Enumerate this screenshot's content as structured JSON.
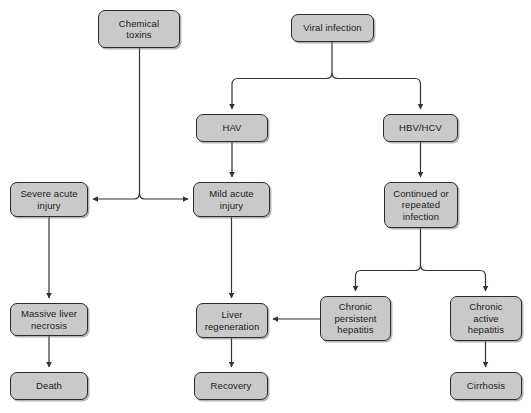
{
  "diagram": {
    "node_fill": "#c9c9c9",
    "node_stroke": "#2b2b2b",
    "edge_color": "#333333",
    "background": "#ffffff",
    "nodes": [
      {
        "id": "chemical-toxins",
        "label": "Chemical\ntoxins",
        "x": 98,
        "y": 10,
        "w": 82,
        "h": 38
      },
      {
        "id": "viral-infection",
        "label": "Viral infection",
        "x": 291,
        "y": 14,
        "w": 83,
        "h": 28
      },
      {
        "id": "hav",
        "label": "HAV",
        "x": 196,
        "y": 114,
        "w": 72,
        "h": 28
      },
      {
        "id": "hbv-hcv",
        "label": "HBV/HCV",
        "x": 383,
        "y": 114,
        "w": 75,
        "h": 28
      },
      {
        "id": "severe-acute-injury",
        "label": "Severe acute\ninjury",
        "x": 10,
        "y": 182,
        "w": 78,
        "h": 35
      },
      {
        "id": "mild-acute-injury",
        "label": "Mild acute\ninjury",
        "x": 193,
        "y": 182,
        "w": 77,
        "h": 35
      },
      {
        "id": "continued-repeated-infection",
        "label": "Continued or\nrepeated\ninfection",
        "x": 384,
        "y": 182,
        "w": 74,
        "h": 46
      },
      {
        "id": "massive-liver-necrosis",
        "label": "Massive liver\nnecrosis",
        "x": 10,
        "y": 303,
        "w": 78,
        "h": 33
      },
      {
        "id": "liver-regeneration",
        "label": "Liver\nregeneration",
        "x": 196,
        "y": 303,
        "w": 72,
        "h": 35
      },
      {
        "id": "chronic-persistent-hepatitis",
        "label": "Chronic\npersistent\nhepatitis",
        "x": 320,
        "y": 296,
        "w": 71,
        "h": 45
      },
      {
        "id": "chronic-active-hepatitis",
        "label": "Chronic\nactive\nhepatitis",
        "x": 450,
        "y": 296,
        "w": 72,
        "h": 45
      },
      {
        "id": "death",
        "label": "Death",
        "x": 10,
        "y": 372,
        "w": 78,
        "h": 28
      },
      {
        "id": "recovery",
        "label": "Recovery",
        "x": 194,
        "y": 372,
        "w": 74,
        "h": 28
      },
      {
        "id": "cirrhosis",
        "label": "Cirrhosis",
        "x": 450,
        "y": 372,
        "w": 72,
        "h": 28
      }
    ],
    "edges": [
      {
        "id": "chemical-toxins-to-severe-acute-injury",
        "from": "chemical-toxins",
        "to": "severe-acute-injury",
        "arrow": true
      },
      {
        "id": "chemical-toxins-to-mild-acute-injury",
        "from": "chemical-toxins",
        "to": "mild-acute-injury",
        "arrow": true
      },
      {
        "id": "viral-infection-to-hav",
        "from": "viral-infection",
        "to": "hav",
        "arrow": true
      },
      {
        "id": "viral-infection-to-hbv-hcv",
        "from": "viral-infection",
        "to": "hbv-hcv",
        "arrow": true
      },
      {
        "id": "hav-to-mild-acute-injury",
        "from": "hav",
        "to": "mild-acute-injury",
        "arrow": true
      },
      {
        "id": "hbv-hcv-to-continued-repeated-infection",
        "from": "hbv-hcv",
        "to": "continued-repeated-infection",
        "arrow": true
      },
      {
        "id": "severe-acute-injury-to-massive-liver-necrosis",
        "from": "severe-acute-injury",
        "to": "massive-liver-necrosis",
        "arrow": true
      },
      {
        "id": "mild-acute-injury-to-liver-regeneration",
        "from": "mild-acute-injury",
        "to": "liver-regeneration",
        "arrow": true
      },
      {
        "id": "continued-repeated-infection-to-chronic-persistent-hepatitis",
        "from": "continued-repeated-infection",
        "to": "chronic-persistent-hepatitis",
        "arrow": true
      },
      {
        "id": "continued-repeated-infection-to-chronic-active-hepatitis",
        "from": "continued-repeated-infection",
        "to": "chronic-active-hepatitis",
        "arrow": true
      },
      {
        "id": "massive-liver-necrosis-to-death",
        "from": "massive-liver-necrosis",
        "to": "death",
        "arrow": true
      },
      {
        "id": "liver-regeneration-to-recovery",
        "from": "liver-regeneration",
        "to": "recovery",
        "arrow": true
      },
      {
        "id": "chronic-persistent-hepatitis-to-liver-regeneration",
        "from": "chronic-persistent-hepatitis",
        "to": "liver-regeneration",
        "arrow": true
      },
      {
        "id": "chronic-active-hepatitis-to-cirrhosis",
        "from": "chronic-active-hepatitis",
        "to": "cirrhosis",
        "arrow": true
      }
    ]
  }
}
